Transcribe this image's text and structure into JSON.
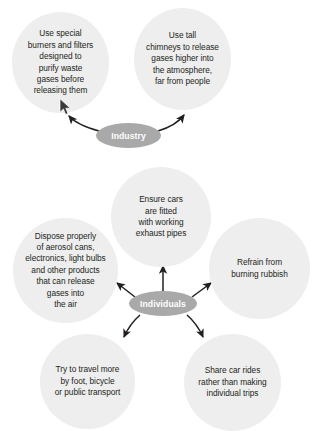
{
  "diagram": {
    "colors": {
      "circle_fill": "#eeeeee",
      "hub_fill": "#a9a9a9",
      "hub_text": "#ffffff",
      "node_text": "#231f20",
      "arrow": "#231f20",
      "background": "#ffffff"
    },
    "hubs": [
      {
        "id": "industry",
        "label": "Industry"
      },
      {
        "id": "individuals",
        "label": "Individuals"
      }
    ],
    "nodes": [
      {
        "id": "burners-filters",
        "hub": "industry",
        "text": "Use special\nburners and filters\ndesigned to\npurify waste\ngases before\nreleasing them"
      },
      {
        "id": "tall-chimneys",
        "hub": "industry",
        "text": "Use tall\nchimneys to release\ngases higher into\nthe atmosphere,\nfar from people"
      },
      {
        "id": "exhaust-pipes",
        "hub": "individuals",
        "text": "Ensure cars\nare fitted\nwith working\nexhaust pipes"
      },
      {
        "id": "dispose-properly",
        "hub": "individuals",
        "text": "Dispose properly\nof aerosol cans,\nelectronics, light bulbs\nand other products\nthat can release\ngases into\nthe air"
      },
      {
        "id": "refrain-burning",
        "hub": "individuals",
        "text": "Refrain from\nburning rubbish"
      },
      {
        "id": "travel-active",
        "hub": "individuals",
        "text": "Try to travel more\nby foot, bicycle\nor public transport"
      },
      {
        "id": "share-car-rides",
        "hub": "individuals",
        "text": "Share car rides\nrather than making\nindividual trips"
      }
    ],
    "connectors": [
      {
        "id": "industry-to-burners-filters",
        "from": "industry",
        "to": "burners-filters",
        "style": "curved-arrow"
      },
      {
        "id": "industry-to-tall-chimneys",
        "from": "industry",
        "to": "tall-chimneys",
        "style": "curved-arrow"
      },
      {
        "id": "individuals-to-exhaust-pipes",
        "from": "individuals",
        "to": "exhaust-pipes",
        "style": "straight-arrow"
      },
      {
        "id": "individuals-to-dispose-properly",
        "from": "individuals",
        "to": "dispose-properly",
        "style": "straight-arrow"
      },
      {
        "id": "individuals-to-refrain-burning",
        "from": "individuals",
        "to": "refrain-burning",
        "style": "straight-arrow"
      },
      {
        "id": "individuals-to-travel-active",
        "from": "individuals",
        "to": "travel-active",
        "style": "curved-arrow"
      },
      {
        "id": "individuals-to-share-car-rides",
        "from": "individuals",
        "to": "share-car-rides",
        "style": "curved-arrow"
      }
    ],
    "pointer": {
      "id": "mouse-cursor",
      "visible": true
    }
  }
}
